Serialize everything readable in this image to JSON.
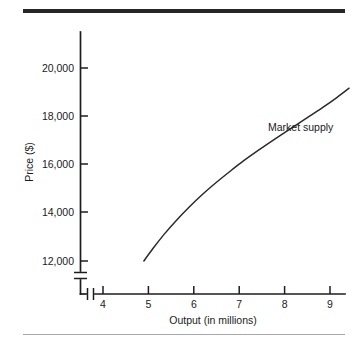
{
  "figure": {
    "background_color": "#ffffff",
    "ink_color": "#1a1a1c",
    "top_rule_color": "#26262a",
    "bottom_rule_color": "#a8a8ac"
  },
  "chart_data": {
    "type": "line",
    "title": "",
    "subtitle": "",
    "xlabel": "Output (in millions)",
    "ylabel": "Price ($)",
    "xlim": [
      3.5,
      9.6
    ],
    "ylim": [
      11200,
      20800
    ],
    "grid": false,
    "legend_position": "inline-annotation",
    "x_axis_break": true,
    "y_axis_break": true,
    "xticks": [
      4,
      5,
      6,
      7,
      8,
      9
    ],
    "xticklabels": [
      "4",
      "5",
      "6",
      "7",
      "8",
      "9"
    ],
    "yticks": [
      12000,
      14000,
      16000,
      18000,
      20000
    ],
    "yticklabels": [
      "12,000",
      "14,000",
      "16,000",
      "18,000",
      "20,000"
    ],
    "annotations": [
      {
        "text": "Market supply",
        "x": 7.55,
        "y": 17150
      }
    ],
    "series": [
      {
        "name": "Market supply",
        "color": "#2a2a2e",
        "x": [
          4.9,
          5.1,
          5.35,
          5.6,
          5.9,
          6.2,
          6.5,
          6.8,
          7.1,
          7.45,
          7.8,
          8.15,
          8.5,
          8.85,
          9.15,
          9.42
        ],
        "y": [
          12000,
          12520,
          13120,
          13660,
          14250,
          14790,
          15280,
          15740,
          16180,
          16650,
          17100,
          17540,
          17970,
          18410,
          18810,
          19200
        ]
      }
    ]
  },
  "labels": {
    "ytick_0": "12,000",
    "ytick_1": "14,000",
    "ytick_2": "16,000",
    "ytick_3": "18,000",
    "ytick_4": "20,000",
    "xtick_0": "4",
    "xtick_1": "5",
    "xtick_2": "6",
    "xtick_3": "7",
    "xtick_4": "8",
    "xtick_5": "9",
    "y_axis_title": "Price ($)",
    "x_axis_title": "Output (in millions)",
    "curve_label": "Market supply"
  }
}
